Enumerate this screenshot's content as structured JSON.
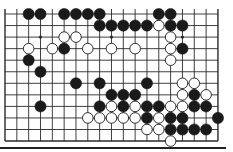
{
  "board": {
    "columns": 19,
    "rows": 12,
    "origin_x": 5,
    "origin_y": 14,
    "spacing_x": 11.83,
    "spacing_y": 11.55,
    "stone_radius": 5.6,
    "colors": {
      "line": "#2a2a2a",
      "black": "#1a1a1a",
      "white": "#ffffff",
      "background": "#ffffff"
    },
    "hoshi": [
      [
        2,
        3
      ],
      [
        2,
        9
      ],
      [
        2,
        15
      ]
    ],
    "black_stones": [
      [
        0,
        2
      ],
      [
        0,
        3
      ],
      [
        0,
        5
      ],
      [
        0,
        6
      ],
      [
        0,
        7
      ],
      [
        0,
        8
      ],
      [
        0,
        13
      ],
      [
        0,
        14
      ],
      [
        1,
        8
      ],
      [
        1,
        9
      ],
      [
        1,
        10
      ],
      [
        1,
        11
      ],
      [
        1,
        12
      ],
      [
        1,
        14
      ],
      [
        1,
        15
      ],
      [
        3,
        5
      ],
      [
        3,
        15
      ],
      [
        4,
        2
      ],
      [
        5,
        3
      ],
      [
        6,
        6
      ],
      [
        6,
        8
      ],
      [
        6,
        12
      ],
      [
        7,
        9
      ],
      [
        7,
        10
      ],
      [
        7,
        11
      ],
      [
        7,
        16
      ],
      [
        8,
        3
      ],
      [
        8,
        8
      ],
      [
        8,
        10
      ],
      [
        8,
        12
      ],
      [
        8,
        13
      ],
      [
        8,
        16
      ],
      [
        8,
        17
      ],
      [
        9,
        12
      ],
      [
        9,
        14
      ],
      [
        9,
        15
      ],
      [
        9,
        18
      ],
      [
        10,
        14
      ],
      [
        10,
        15
      ],
      [
        10,
        16
      ],
      [
        10,
        17
      ]
    ],
    "white_stones": [
      [
        1,
        13
      ],
      [
        2,
        5
      ],
      [
        2,
        6
      ],
      [
        2,
        14
      ],
      [
        3,
        2
      ],
      [
        3,
        4
      ],
      [
        3,
        7
      ],
      [
        3,
        9
      ],
      [
        3,
        11
      ],
      [
        3,
        14
      ],
      [
        4,
        14
      ],
      [
        6,
        15
      ],
      [
        6,
        16
      ],
      [
        7,
        15
      ],
      [
        7,
        17
      ],
      [
        8,
        9
      ],
      [
        8,
        11
      ],
      [
        8,
        14
      ],
      [
        8,
        15
      ],
      [
        9,
        7
      ],
      [
        9,
        8
      ],
      [
        9,
        9
      ],
      [
        9,
        10
      ],
      [
        9,
        11
      ],
      [
        9,
        13
      ],
      [
        10,
        12
      ],
      [
        10,
        13
      ],
      [
        11,
        14
      ]
    ]
  }
}
